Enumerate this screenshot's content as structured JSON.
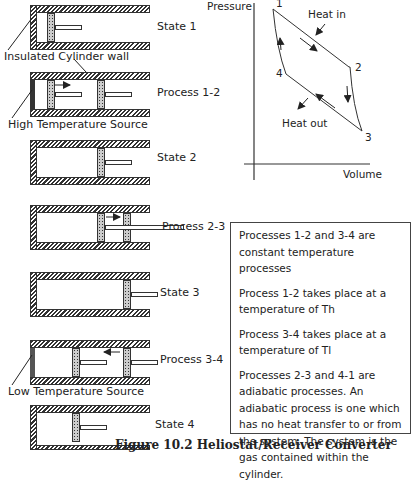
{
  "figure": {
    "caption": "Figure 10.2 Heliostat/Receiver Converter"
  },
  "cylinders": [
    {
      "label": "State 1"
    },
    {
      "label": "Process 1-2"
    },
    {
      "label": "State 2"
    },
    {
      "label": "Process 2-3"
    },
    {
      "label": "State 3"
    },
    {
      "label": "Process 3-4"
    },
    {
      "label": "State 4"
    }
  ],
  "annotations": {
    "insulated_wall": "Insulated Cylinder wall",
    "high_source": "High Temperature Source",
    "low_source": "Low Temperature Source"
  },
  "pv_diagram": {
    "y_axis": "Pressure",
    "x_axis": "Volume",
    "points": [
      "1",
      "2",
      "3",
      "4"
    ],
    "heat_in": "Heat in",
    "heat_out": "Heat out"
  },
  "notes": [
    "Processes 1-2 and 3-4 are constant temperature processes",
    "Process 1-2 takes place at a temperature of Th",
    "Process 3-4 takes place at a temperature of Tl",
    "Processes 2-3 and 4-1 are adiabatic processes.  An adiabatic process is one which has no heat transfer to or from the system. The system is the gas contained within the cylinder."
  ]
}
